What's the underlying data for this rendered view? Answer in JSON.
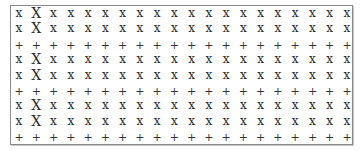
{
  "grid": {
    "rows": 9,
    "columns": 20,
    "symbols": {
      "lower_x": "x",
      "upper_x": "X",
      "plus": "+"
    },
    "cells": [
      [
        "x",
        "X",
        "x",
        "x",
        "x",
        "x",
        "x",
        "x",
        "x",
        "x",
        "x",
        "x",
        "x",
        "x",
        "x",
        "x",
        "x",
        "x",
        "x",
        "x"
      ],
      [
        "x",
        "X",
        "x",
        "x",
        "x",
        "x",
        "x",
        "x",
        "x",
        "x",
        "x",
        "x",
        "x",
        "x",
        "x",
        "x",
        "x",
        "x",
        "x",
        "x"
      ],
      [
        "+",
        "+",
        "+",
        "+",
        "+",
        "+",
        "+",
        "+",
        "+",
        "+",
        "+",
        "+",
        "+",
        "+",
        "+",
        "+",
        "+",
        "+",
        "+",
        "+"
      ],
      [
        "x",
        "X",
        "x",
        "x",
        "x",
        "x",
        "x",
        "x",
        "x",
        "x",
        "x",
        "x",
        "x",
        "x",
        "x",
        "x",
        "x",
        "x",
        "x",
        "x"
      ],
      [
        "x",
        "X",
        "x",
        "x",
        "x",
        "x",
        "x",
        "x",
        "x",
        "x",
        "x",
        "x",
        "x",
        "x",
        "x",
        "x",
        "x",
        "x",
        "x",
        "x"
      ],
      [
        "+",
        "+",
        "+",
        "+",
        "+",
        "+",
        "+",
        "+",
        "+",
        "+",
        "+",
        "+",
        "+",
        "+",
        "+",
        "+",
        "+",
        "+",
        "+",
        "+"
      ],
      [
        "x",
        "X",
        "x",
        "x",
        "x",
        "x",
        "x",
        "x",
        "x",
        "x",
        "x",
        "x",
        "x",
        "x",
        "x",
        "x",
        "x",
        "x",
        "x",
        "x"
      ],
      [
        "x",
        "X",
        "x",
        "x",
        "x",
        "x",
        "x",
        "x",
        "x",
        "x",
        "x",
        "x",
        "x",
        "x",
        "x",
        "x",
        "x",
        "x",
        "x",
        "x"
      ],
      [
        "+",
        "+",
        "+",
        "+",
        "+",
        "+",
        "+",
        "+",
        "+",
        "+",
        "+",
        "+",
        "+",
        "+",
        "+",
        "+",
        "+",
        "+",
        "+",
        "+"
      ]
    ]
  },
  "colors": {
    "border": "#8a8a8a",
    "glyph": "#2a2a2a",
    "background": "#ffffff"
  }
}
